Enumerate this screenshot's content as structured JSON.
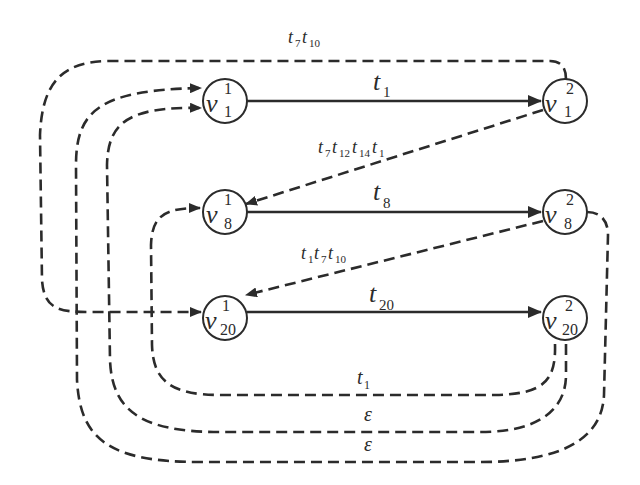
{
  "diagram": {
    "type": "state-transition-graph",
    "colors": {
      "stroke": "#2b2b2b",
      "background": "#ffffff"
    },
    "nodes": [
      {
        "id": "v1_1",
        "name": "v",
        "sub": "1",
        "sup": "1",
        "x": 225,
        "y": 101
      },
      {
        "id": "v1_2",
        "name": "v",
        "sub": "1",
        "sup": "2",
        "x": 565,
        "y": 101
      },
      {
        "id": "v8_1",
        "name": "v",
        "sub": "8",
        "sup": "1",
        "x": 225,
        "y": 212
      },
      {
        "id": "v8_2",
        "name": "v",
        "sub": "8",
        "sup": "2",
        "x": 565,
        "y": 212
      },
      {
        "id": "v20_1",
        "name": "v",
        "sub": "20",
        "sup": "1",
        "x": 225,
        "y": 322
      },
      {
        "id": "v20_2",
        "name": "v",
        "sub": "20",
        "sup": "2",
        "x": 565,
        "y": 322
      }
    ],
    "solid_edges": [
      {
        "from": "v1_1",
        "to": "v1_2",
        "label": {
          "base": "t",
          "sub": "1"
        }
      },
      {
        "from": "v8_1",
        "to": "v8_2",
        "label": {
          "base": "t",
          "sub": "8"
        }
      },
      {
        "from": "v20_1",
        "to": "v20_2",
        "label": {
          "base": "t",
          "sub": "20"
        }
      }
    ],
    "dashed_edges": [
      {
        "from": "v1_2",
        "to": "v20_1",
        "label": "t7 t10",
        "label_parts": [
          {
            "base": "t",
            "sub": "7"
          },
          {
            "base": "t",
            "sub": "10"
          }
        ]
      },
      {
        "from": "v1_2",
        "to": "v8_1",
        "label": "t7 t12 t14 t1",
        "label_parts": [
          {
            "base": "t",
            "sub": "7"
          },
          {
            "base": "t",
            "sub": "12"
          },
          {
            "base": "t",
            "sub": "14"
          },
          {
            "base": "t",
            "sub": "1"
          }
        ]
      },
      {
        "from": "v8_2",
        "to": "v20_1",
        "label": "t1 t7 t10",
        "label_parts": [
          {
            "base": "t",
            "sub": "1"
          },
          {
            "base": "t",
            "sub": "7"
          },
          {
            "base": "t",
            "sub": "10"
          }
        ]
      },
      {
        "from": "v20_2",
        "to": "v8_1",
        "label": "t1",
        "label_parts": [
          {
            "base": "t",
            "sub": "1"
          }
        ]
      },
      {
        "from": "v20_2",
        "to": "v1_1",
        "label": "ε",
        "label_parts": [
          {
            "base": "ε",
            "sub": ""
          }
        ]
      },
      {
        "from": "v8_2",
        "to": "v1_1",
        "label": "ε",
        "label_parts": [
          {
            "base": "ε",
            "sub": ""
          }
        ]
      }
    ]
  },
  "labels": {
    "n_v1_1": {
      "base": "v",
      "sub": "1",
      "sup": "1"
    },
    "n_v1_2": {
      "base": "v",
      "sub": "1",
      "sup": "2"
    },
    "n_v8_1": {
      "base": "v",
      "sub": "8",
      "sup": "1"
    },
    "n_v8_2": {
      "base": "v",
      "sub": "8",
      "sup": "2"
    },
    "n_v20_1": {
      "base": "v",
      "sub": "20",
      "sup": "1"
    },
    "n_v20_2": {
      "base": "v",
      "sub": "20",
      "sup": "2"
    },
    "e_t1": {
      "base": "t",
      "sub": "1"
    },
    "e_t8": {
      "base": "t",
      "sub": "8"
    },
    "e_t20": {
      "base": "t",
      "sub": "20"
    },
    "top": {
      "a": "t",
      "a_sub": "7",
      "b": "t",
      "b_sub": "10"
    },
    "diag1": {
      "a": "t",
      "a_sub": "7",
      "b": "t",
      "b_sub": "12",
      "c": "t",
      "c_sub": "14",
      "d": "t",
      "d_sub": "1"
    },
    "diag2": {
      "a": "t",
      "a_sub": "1",
      "b": "t",
      "b_sub": "7",
      "c": "t",
      "c_sub": "10"
    },
    "bottom1": {
      "base": "t",
      "sub": "1"
    },
    "bottom2": {
      "base": "ε"
    },
    "bottom3": {
      "base": "ε"
    }
  }
}
